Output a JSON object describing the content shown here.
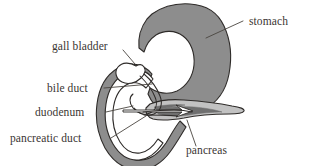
{
  "figure": {
    "background_color": "#ffffff"
  },
  "colors": {
    "stomach_fill": "#8d8d8d",
    "duodenum_fill": "#8d8d8d",
    "pancreas_fill": "#c2c2c2",
    "pancreas_dark": "#6f6f6f",
    "lumen_fill": "#ffffff",
    "outline": "#2e2b29",
    "leader": "#4a4540",
    "text": "#3a3532"
  },
  "labels": [
    {
      "id": "stomach",
      "text": "stomach",
      "text_x": 249,
      "text_y": 25,
      "anchor": "start",
      "leader": "M 243 21 L 206 38"
    },
    {
      "id": "gall-bladder",
      "text": "gall bladder",
      "text_x": 52,
      "text_y": 50,
      "anchor": "start",
      "leader": "M 123 50 L 135 64"
    },
    {
      "id": "bile-duct",
      "text": "bile duct",
      "text_x": 47,
      "text_y": 92,
      "anchor": "start",
      "leader": "M 104 88 L 152 84"
    },
    {
      "id": "duodenum",
      "text": "duodenum",
      "text_x": 35,
      "text_y": 116,
      "anchor": "start",
      "leader": "M 106 112 L 133 106"
    },
    {
      "id": "pancreatic-duct",
      "text": "pancreatic duct",
      "text_x": 10,
      "text_y": 142,
      "anchor": "start",
      "leader": "M 111 138 L 146 116"
    },
    {
      "id": "pancreas",
      "text": "pancreas",
      "text_x": 186,
      "text_y": 154,
      "anchor": "start",
      "leader": "M 196 146 L 187 120"
    }
  ],
  "organs": {
    "stomach": {
      "name": "stomach",
      "fill": "#8d8d8d",
      "path": "M 152 14 C 162 7 176 3 190 4 C 206 5 218 13 224 26 C 231 41 232 58 229 74 C 226 90 217 103 203 110 C 190 117 175 117 164 112 C 156 108 151 101 148 94 L 150 88 C 158 93 168 95 177 91 C 187 86 193 76 194 65 C 195 53 191 42 183 36 C 175 30 164 30 156 35 C 150 39 146 45 144 52 L 139 48 C 138 38 141 27 147 19 Z"
    },
    "duodenum": {
      "name": "duodenum",
      "fill": "#8d8d8d",
      "outer_path": "M 147 86 C 141 78 132 76 124 80 C 115 85 110 96 109 108 C 108 122 111 135 117 145 C 123 155 132 161 142 160 C 152 159 160 152 166 143 C 171 135 175 127 180 121 L 186 127 C 181 135 176 144 170 152 C 162 163 150 171 137 170 C 123 169 112 160 105 148 C 98 135 95 119 97 104 C 99 88 106 75 118 68 C 130 61 144 64 152 74 Z",
      "inner_path": "M 146 88 C 140 82 132 81 126 85 C 118 90 114 100 113 111 C 112 123 115 134 120 142 C 125 150 132 154 140 153 C 147 152 153 147 158 139 L 163 143 C 157 152 149 159 139 160 C 128 161 119 154 113 144 C 106 132 104 117 106 104 C 108 90 115 79 125 73 C 136 67 147 70 153 79 Z"
    },
    "pancreas": {
      "name": "pancreas",
      "fill": "#c2c2c2",
      "path": "M 150 104 C 160 100 172 99 184 100 C 200 101 218 103 232 106 C 240 107 245 109 244 111 C 243 113 237 114 229 114 C 215 114 198 115 184 118 C 172 120 161 121 153 119 C 147 117 145 112 146 108 Z",
      "detail_paths": [
        "M 156 110 C 166 107 180 106 194 107 C 206 108 216 110 222 112 C 213 112 200 113 189 115 C 177 117 165 116 158 114 Z",
        "M 160 112 C 170 110 182 110 193 111 C 184 112 173 114 164 115 Z",
        "M 154 107 C 163 105 174 104 185 105 C 176 106 165 108 157 110 Z"
      ]
    },
    "gall_bladder": {
      "name": "gall bladder",
      "fill": "#ffffff",
      "path": "M 136 66 C 130 62 122 62 118 67 C 114 72 116 79 122 82 C 128 85 136 83 141 78 C 145 74 146 70 144 67 C 142 64 139 64 136 66 Z"
    },
    "bile_duct": {
      "name": "bile duct",
      "paths": [
        "M 140 76 C 146 82 152 89 155 97 C 158 104 156 110 150 113 C 144 116 137 113 133 108 C 129 103 129 97 133 94",
        "M 144 74 C 151 80 157 88 160 96 C 163 104 161 111 154 114 C 147 117 139 114 134 108"
      ]
    },
    "pancreatic_duct": {
      "name": "pancreatic duct",
      "paths": [
        "M 143 112 C 152 111 163 110 174 110 C 182 110 188 111 192 112",
        "M 144 115 C 154 115 166 115 177 116"
      ]
    },
    "ampulla_arrow": {
      "name": "ampulla arrow",
      "path": "M 123 110 L 182 110 L 176 105 L 193 111 L 176 117 L 182 112 L 123 112 Z"
    }
  }
}
